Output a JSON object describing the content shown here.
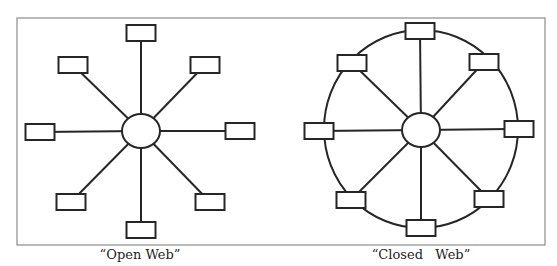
{
  "colors": {
    "stroke": "#262626",
    "frame": "#8c8c8c",
    "background": "#ffffff",
    "fill": "#ffffff"
  },
  "frame": {
    "x": 17,
    "y": 18,
    "w": 528,
    "h": 227
  },
  "diagrams": [
    {
      "id": "open-web",
      "caption": "“Open Web”",
      "hub": {
        "cx": 141,
        "cy": 131,
        "rx": 19,
        "ry": 17
      },
      "ring": null,
      "node_size": {
        "w": 29,
        "h": 16
      },
      "nodes": [
        {
          "position": "top",
          "cx": 141,
          "cy": 33
        },
        {
          "position": "top-right",
          "cx": 205,
          "cy": 65
        },
        {
          "position": "right",
          "cx": 240,
          "cy": 131
        },
        {
          "position": "bottom-right",
          "cx": 210,
          "cy": 202
        },
        {
          "position": "bottom",
          "cx": 141,
          "cy": 230
        },
        {
          "position": "bottom-left",
          "cx": 71,
          "cy": 202
        },
        {
          "position": "left",
          "cx": 40,
          "cy": 132
        },
        {
          "position": "top-left",
          "cx": 73,
          "cy": 65
        }
      ]
    },
    {
      "id": "closed-web",
      "caption": "“Closed   Web”",
      "hub": {
        "cx": 421,
        "cy": 130,
        "rx": 19,
        "ry": 17
      },
      "ring": {
        "cx": 421,
        "cy": 129,
        "rx": 97,
        "ry": 99
      },
      "node_size": {
        "w": 29,
        "h": 16
      },
      "nodes": [
        {
          "position": "top",
          "cx": 420,
          "cy": 31
        },
        {
          "position": "top-right",
          "cx": 484,
          "cy": 62
        },
        {
          "position": "right",
          "cx": 519,
          "cy": 129
        },
        {
          "position": "bottom-right",
          "cx": 489,
          "cy": 199
        },
        {
          "position": "bottom",
          "cx": 421,
          "cy": 228
        },
        {
          "position": "bottom-left",
          "cx": 351,
          "cy": 200
        },
        {
          "position": "left",
          "cx": 319,
          "cy": 131
        },
        {
          "position": "top-left",
          "cx": 352,
          "cy": 63
        }
      ]
    }
  ]
}
